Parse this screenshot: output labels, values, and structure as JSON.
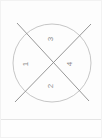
{
  "figure": {
    "name": "quadrant-circle-diagram",
    "background_color": "#fdfdfd",
    "circle": {
      "center_x": 51,
      "center_y": 62,
      "radius": 39,
      "stroke_color": "#b8b8b8",
      "stroke_width": 0.8
    },
    "diagonals": [
      {
        "name": "diagonal-nw-se",
        "x1": 16,
        "y1": 22,
        "x2": 88,
        "y2": 100,
        "stroke_color": "#8a8a8a",
        "stroke_width": 0.9
      },
      {
        "name": "diagonal-sw-ne",
        "x1": 14,
        "y1": 101,
        "x2": 90,
        "y2": 23,
        "stroke_color": "#8a8a8a",
        "stroke_width": 0.9
      }
    ],
    "labels": {
      "top": "3",
      "left": "1",
      "right": "4",
      "bottom": "2"
    },
    "label_color": "#8d8d8d",
    "label_rotation_degrees": -90
  },
  "separator": {
    "color": "#e4e4e4"
  }
}
